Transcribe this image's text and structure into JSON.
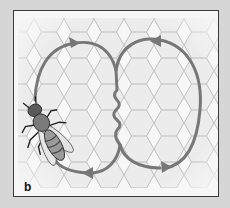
{
  "figure": {
    "panel_label": "b",
    "elements": {
      "bee": "worker-bee",
      "comb": "hexagonal-honeycomb",
      "path": "figure-eight dance path with waggle run"
    },
    "colors": {
      "background": "#d6d6d6",
      "panel": "#f7f7f7",
      "frame": "#3a3a3a",
      "arrow": "#777777",
      "comb_line": "#b8b8b8"
    },
    "arrows": [
      {
        "loop": "left",
        "position": "top",
        "direction": "right"
      },
      {
        "loop": "left",
        "position": "bottom",
        "direction": "left"
      },
      {
        "loop": "right",
        "position": "top",
        "direction": "left"
      },
      {
        "loop": "right",
        "position": "bottom",
        "direction": "right"
      }
    ]
  }
}
